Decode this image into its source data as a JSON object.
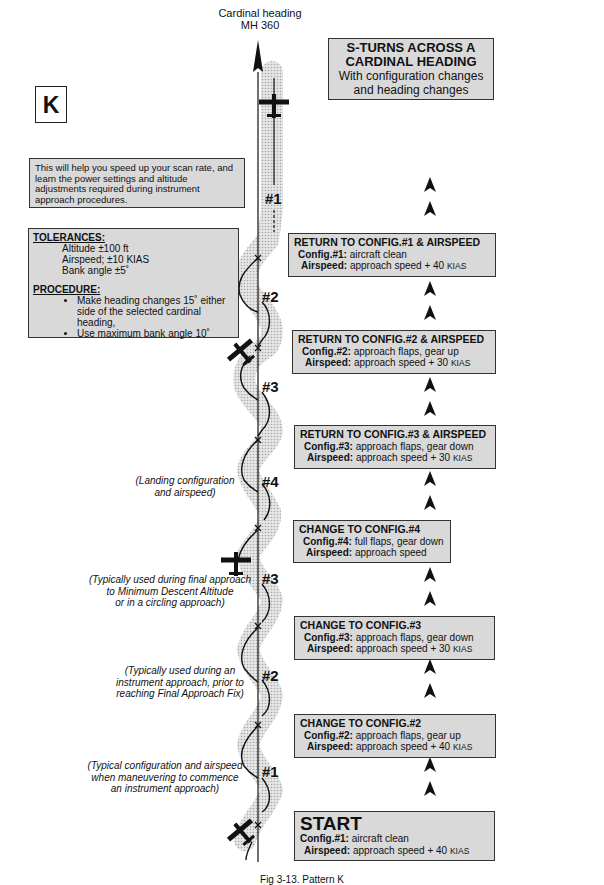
{
  "header": {
    "heading_label_line1": "Cardinal heading",
    "heading_label_line2": "MH 360",
    "title_line1": "S-TURNS ACROSS A",
    "title_line2": "CARDINAL HEADING",
    "subtitle_line1": "With configuration changes",
    "subtitle_line2": "and heading changes",
    "pattern_letter": "K"
  },
  "intro": {
    "text": "This will help you speed up your scan rate, and learn the power settings and altitude adjustments required during instrument approach procedures."
  },
  "tolerances": {
    "header": "TOLERANCES:",
    "items": [
      "Altitude ±100 ft",
      "Airspeed; ±10 KIAS",
      "Bank angle ±5˚"
    ]
  },
  "procedure": {
    "header": "PROCEDURE:",
    "items": [
      "Make heading changes 15˚ either side of the selected cardinal heading,",
      "Use maximum bank angle 10˚"
    ]
  },
  "steps": [
    {
      "title": "RETURN TO CONFIG.#1 & AIRSPEED",
      "config_label": "Config.#1:",
      "config_value": "aircraft clean",
      "airspeed_label": "Airspeed:",
      "airspeed_value": "approach speed + 40",
      "airspeed_unit": "KIAS"
    },
    {
      "title": "RETURN TO CONFIG.#2 & AIRSPEED",
      "config_label": "Config.#2:",
      "config_value": "approach flaps, gear up",
      "airspeed_label": "Airspeed:",
      "airspeed_value": "approach speed + 30",
      "airspeed_unit": "KIAS"
    },
    {
      "title": "RETURN TO CONFIG.#3 & AIRSPEED",
      "config_label": "Config.#3:",
      "config_value": "approach flaps, gear down",
      "airspeed_label": "Airspeed:",
      "airspeed_value": "approach speed + 30",
      "airspeed_unit": "KIAS"
    },
    {
      "title": "CHANGE TO CONFIG.#4",
      "config_label": "Config.#4:",
      "config_value": "full flaps, gear down",
      "airspeed_label": "Airspeed:",
      "airspeed_value": "approach speed",
      "airspeed_unit": ""
    },
    {
      "title": "CHANGE TO CONFIG.#3",
      "config_label": "Config.#3:",
      "config_value": "approach flaps, gear down",
      "airspeed_label": "Airspeed:",
      "airspeed_value": "approach speed + 30",
      "airspeed_unit": "KIAS"
    },
    {
      "title": "CHANGE TO CONFIG.#2",
      "config_label": "Config.#2:",
      "config_value": "approach flaps, gear up",
      "airspeed_label": "Airspeed:",
      "airspeed_value": "approach speed + 40",
      "airspeed_unit": "KIAS"
    },
    {
      "title": "START",
      "config_label": "Config.#1:",
      "config_value": "aircraft clean",
      "airspeed_label": "Airspeed:",
      "airspeed_value": "approach speed + 40",
      "airspeed_unit": "KIAS"
    }
  ],
  "path_labels": [
    "#1",
    "#2",
    "#3",
    "#4",
    "#3",
    "#2",
    "#1"
  ],
  "notes": [
    {
      "line1": "(Landing configuration",
      "line2": "and airspeed)",
      "line3": ""
    },
    {
      "line1": "(Typically used during final approach",
      "line2": "to Minimum Descent Altitude",
      "line3": "or in a circling approach)"
    },
    {
      "line1": "(Typically used during an",
      "line2": "instrument approach, prior to",
      "line3": "reaching Final Approach Fix)"
    },
    {
      "line1": "(Typical configuration and airspeed",
      "line2": "when maneuvering to commence",
      "line3": "an instrument approach)"
    }
  ],
  "icons": {
    "heading_arrow": "north-arrow-icon",
    "direction_arrows": "chevron-up-icon",
    "aircraft": "airplane-icon"
  },
  "colors": {
    "box_fill": "#d9d9d9",
    "shading": "#c8c8c8",
    "ink": "#111111"
  },
  "caption": "Fig 3-13. Pattern K"
}
